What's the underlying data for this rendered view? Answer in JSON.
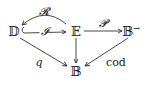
{
  "diagram": {
    "nodes": [
      {
        "id": "D",
        "label": "𝔻"
      },
      {
        "id": "E",
        "label": "𝔼"
      },
      {
        "id": "Barrow",
        "label": "𝔹",
        "superscript": "→"
      },
      {
        "id": "B",
        "label": "𝔹"
      }
    ],
    "edges": [
      {
        "from": "E",
        "to": "D",
        "label": "𝓡",
        "style": "curved-above"
      },
      {
        "from": "D",
        "to": "E",
        "label": "𝓘",
        "style": "hook-inclusion"
      },
      {
        "from": "E",
        "to": "Barrow",
        "label": "𝓟"
      },
      {
        "from": "D",
        "to": "B",
        "label": "q"
      },
      {
        "from": "E",
        "to": "B",
        "label": ""
      },
      {
        "from": "Barrow",
        "to": "B",
        "label": "cod"
      }
    ]
  }
}
